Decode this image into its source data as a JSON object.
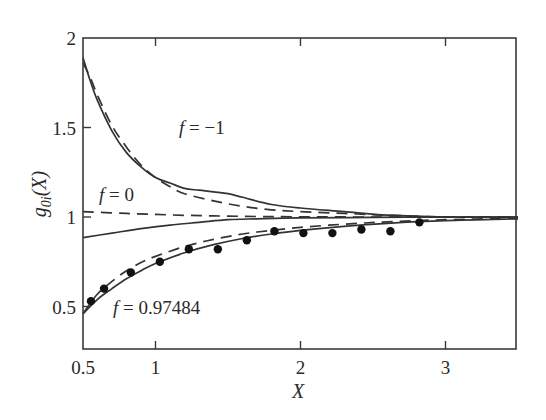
{
  "chart_data": {
    "type": "line",
    "title": "",
    "xlabel": "X",
    "ylabel": "g0i(X)",
    "ylabel_main": "g",
    "ylabel_sub": "0i",
    "ylabel_tail": "(X)",
    "xlim": [
      0.5,
      3.5
    ],
    "ylim": [
      0.27,
      2.0
    ],
    "xticks": [
      0.5,
      1,
      2,
      3
    ],
    "xtick_labels": [
      "0.5",
      "1",
      "2",
      "3"
    ],
    "yticks": [
      0.5,
      1,
      1.5,
      2
    ],
    "ytick_labels": [
      "0.5",
      "1",
      "1.5",
      "2"
    ],
    "grid": false,
    "legend": "none (inline annotations)",
    "annotations": [
      {
        "text_f": "f",
        "text_rest": " = −1",
        "x": 1.05,
        "y": 1.46
      },
      {
        "text_f": "f",
        "text_rest": " = 0",
        "x": 0.62,
        "y": 1.09
      },
      {
        "text_f": "f",
        "text_rest": " = 0.97484",
        "x": 0.83,
        "y": 0.47
      }
    ],
    "series": [
      {
        "name": "f = -1 (solid)",
        "style": "solid",
        "x": [
          0.5,
          0.55,
          0.6,
          0.7,
          0.8,
          0.9,
          1.0,
          1.1,
          1.2,
          1.3,
          1.4,
          1.5,
          1.6,
          1.8,
          2.0,
          2.3,
          2.6,
          3.0,
          3.5
        ],
        "y": [
          1.89,
          1.76,
          1.65,
          1.48,
          1.36,
          1.28,
          1.22,
          1.19,
          1.16,
          1.15,
          1.14,
          1.13,
          1.11,
          1.07,
          1.05,
          1.03,
          1.01,
          1.0,
          1.0
        ]
      },
      {
        "name": "f = -1 (dashed)",
        "style": "dashed",
        "x": [
          0.5,
          0.55,
          0.6,
          0.7,
          0.8,
          0.9,
          1.0,
          1.1,
          1.2,
          1.4,
          1.6,
          1.8,
          2.0,
          2.3,
          2.6,
          3.0,
          3.5
        ],
        "y": [
          1.86,
          1.78,
          1.68,
          1.51,
          1.39,
          1.29,
          1.22,
          1.17,
          1.13,
          1.09,
          1.06,
          1.04,
          1.03,
          1.02,
          1.01,
          1.0,
          1.0
        ]
      },
      {
        "name": "f = 0 (solid)",
        "style": "solid",
        "x": [
          0.5,
          0.7,
          0.9,
          1.1,
          1.3,
          1.5,
          1.7,
          2.0,
          2.5,
          3.0,
          3.5
        ],
        "y": [
          0.885,
          0.91,
          0.935,
          0.955,
          0.97,
          0.985,
          0.99,
          0.995,
          0.998,
          0.999,
          1.0
        ]
      },
      {
        "name": "f = 0 (dashed)",
        "style": "dashed",
        "x": [
          0.5,
          0.8,
          1.1,
          1.4,
          1.7,
          2.0,
          2.5,
          3.0,
          3.5
        ],
        "y": [
          1.03,
          1.02,
          1.012,
          1.006,
          1.003,
          1.001,
          1.0,
          1.0,
          1.0
        ]
      },
      {
        "name": "f = 0.97484 (solid)",
        "style": "solid",
        "x": [
          0.5,
          0.6,
          0.7,
          0.8,
          0.9,
          1.0,
          1.2,
          1.4,
          1.6,
          1.8,
          2.0,
          2.3,
          2.6,
          3.0,
          3.5
        ],
        "y": [
          0.46,
          0.54,
          0.6,
          0.655,
          0.7,
          0.74,
          0.8,
          0.845,
          0.88,
          0.905,
          0.925,
          0.948,
          0.965,
          0.98,
          0.99
        ]
      },
      {
        "name": "f = 0.97484 (dashed)",
        "style": "dashed",
        "x": [
          0.5,
          0.6,
          0.7,
          0.8,
          0.9,
          1.0,
          1.2,
          1.4,
          1.6,
          1.8,
          2.0,
          2.3,
          2.6,
          3.0,
          3.5
        ],
        "y": [
          0.46,
          0.57,
          0.64,
          0.7,
          0.745,
          0.78,
          0.835,
          0.875,
          0.905,
          0.925,
          0.942,
          0.96,
          0.973,
          0.985,
          0.993
        ]
      },
      {
        "name": "simulation points",
        "style": "markers",
        "x": [
          0.555,
          0.645,
          0.83,
          1.03,
          1.23,
          1.43,
          1.63,
          1.82,
          2.02,
          2.22,
          2.42,
          2.62,
          2.82
        ],
        "y": [
          0.53,
          0.6,
          0.69,
          0.75,
          0.82,
          0.82,
          0.87,
          0.92,
          0.91,
          0.91,
          0.93,
          0.92,
          0.97
        ]
      }
    ]
  },
  "colors": {
    "line": "#333333",
    "axis": "#3a3a3a",
    "marker": "#111111",
    "background": "#ffffff"
  }
}
